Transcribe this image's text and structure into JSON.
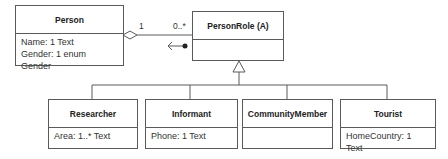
{
  "diagram": {
    "type": "UML class diagram",
    "classes": [
      {
        "id": "person",
        "name": "Person",
        "attributes": [
          "Name: 1 Text",
          "Gender: 1 enum Gender"
        ]
      },
      {
        "id": "personrole",
        "name": "PersonRole (A)",
        "attributes": []
      },
      {
        "id": "researcher",
        "name": "Researcher",
        "attributes": [
          "Area: 1..* Text"
        ]
      },
      {
        "id": "informant",
        "name": "Informant",
        "attributes": [
          "Phone: 1 Text"
        ]
      },
      {
        "id": "communitymember",
        "name": "CommunityMember",
        "attributes": []
      },
      {
        "id": "tourist",
        "name": "Tourist",
        "attributes": [
          "HomeCountry: 1 Text"
        ]
      }
    ],
    "association": {
      "from": "Person",
      "to": "PersonRole (A)",
      "kind": "aggregation",
      "mult_from": "1",
      "mult_to": "0..*",
      "reading_direction": "toward Person"
    },
    "generalization": {
      "parent": "PersonRole (A)",
      "children": [
        "Researcher",
        "Informant",
        "CommunityMember",
        "Tourist"
      ]
    },
    "colors": {
      "line": "#5a5a5a",
      "text": "#333333",
      "background": "#ffffff"
    }
  }
}
